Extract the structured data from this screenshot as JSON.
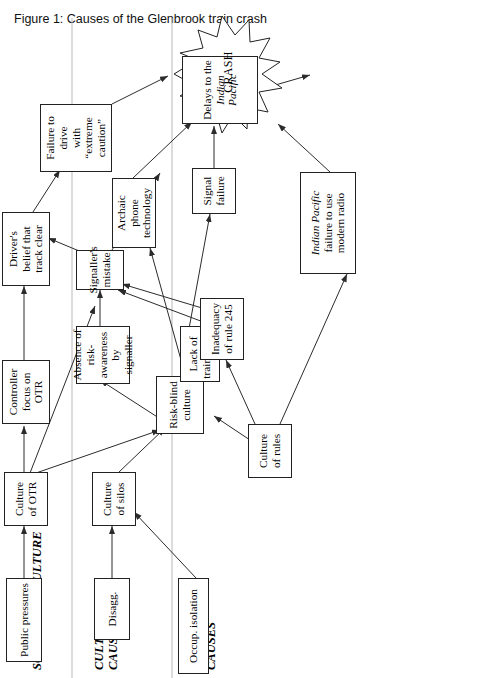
{
  "figure": {
    "caption": "Figure 1: Causes of the Glenbrook train crash",
    "columns": [
      {
        "id": "sources",
        "label": "SOURCES OF CULTURE"
      },
      {
        "id": "cultural",
        "label": "CULTURAL\nCAUSES"
      },
      {
        "id": "specific",
        "label": "SPECIFIC\nCAUSES"
      }
    ],
    "outcome_label": "CRASH",
    "colors": {
      "box_border": "#222222",
      "edge": "#2b2b2b",
      "divider": "#b9b9b9",
      "background": "#ffffff"
    },
    "nodes": [
      {
        "id": "public_pressures",
        "label": "Public pressures",
        "column": "sources"
      },
      {
        "id": "disagg",
        "label": "Disagg.",
        "column": "sources"
      },
      {
        "id": "occup_isolation",
        "label": "Occup. isolation",
        "column": "sources"
      },
      {
        "id": "culture_otr",
        "label": "Culture\nof OTR",
        "column": "cultural"
      },
      {
        "id": "culture_silos",
        "label": "Culture\nof silos",
        "column": "cultural"
      },
      {
        "id": "risk_blind",
        "label": "Risk-blind\nculture",
        "column": "cultural"
      },
      {
        "id": "culture_rules",
        "label": "Culture\nof rules",
        "column": "cultural"
      },
      {
        "id": "controller_focus",
        "label": "Controller\nfocus on\nOTR",
        "column": "specific"
      },
      {
        "id": "absence_risk",
        "label": "Absence of\nrisk-awareness\nby signaller",
        "column": "specific"
      },
      {
        "id": "lack_board",
        "label": "Lack of\ntrain board",
        "column": "specific"
      },
      {
        "id": "inadequacy_245",
        "label": "Inadequacy\nof rule 245",
        "column": "specific"
      },
      {
        "id": "drivers_belief",
        "label": "Driver's\nbelief that\ntrack clear",
        "column": "specific"
      },
      {
        "id": "signallers_mistake",
        "label": "Signaller's\nmistake",
        "column": "specific"
      },
      {
        "id": "archaic_phone",
        "label": "Archaic phone\ntechnology",
        "column": "specific"
      },
      {
        "id": "signal_failure",
        "label": "Signal\nfailure",
        "column": "specific"
      },
      {
        "id": "ip_radio",
        "label_italic": "Indian Pacific",
        "label_rest": "failure to use\nmodern radio",
        "column": "specific"
      },
      {
        "id": "delays_ip",
        "label_plain": "Delays to the",
        "label_italic2": "Indian Pacific",
        "column": "specific"
      },
      {
        "id": "failure_drive",
        "label": "Failure to drive\nwith “extreme\ncaution”",
        "column": "specific"
      }
    ],
    "edges": [
      {
        "from": "public_pressures",
        "to": "culture_otr"
      },
      {
        "from": "disagg",
        "to": "culture_silos"
      },
      {
        "from": "occup_isolation",
        "to": "culture_silos"
      },
      {
        "from": "culture_otr",
        "to": "risk_blind"
      },
      {
        "from": "culture_silos",
        "to": "risk_blind"
      },
      {
        "from": "culture_rules",
        "to": "risk_blind"
      },
      {
        "from": "culture_rules",
        "to": "inadequacy_245"
      },
      {
        "from": "culture_rules",
        "to": "ip_radio"
      },
      {
        "from": "culture_otr",
        "to": "controller_focus"
      },
      {
        "from": "culture_otr",
        "to": "signallers_mistake"
      },
      {
        "from": "risk_blind",
        "to": "absence_risk"
      },
      {
        "from": "risk_blind",
        "to": "lack_board"
      },
      {
        "from": "risk_blind",
        "to": "archaic_phone"
      },
      {
        "from": "risk_blind",
        "to": "signal_failure"
      },
      {
        "from": "inadequacy_245",
        "to": "signallers_mistake"
      },
      {
        "from": "lack_board",
        "to": "signallers_mistake"
      },
      {
        "from": "absence_risk",
        "to": "signallers_mistake"
      },
      {
        "from": "controller_focus",
        "to": "drivers_belief"
      },
      {
        "from": "signallers_mistake",
        "to": "drivers_belief"
      },
      {
        "from": "signallers_mistake",
        "to": "failure_drive"
      },
      {
        "from": "drivers_belief",
        "to": "failure_drive"
      },
      {
        "from": "signal_failure",
        "to": "delays_ip"
      },
      {
        "from": "ip_radio",
        "to": "delays_ip"
      },
      {
        "from": "archaic_phone",
        "to": "delays_ip"
      },
      {
        "from": "delays_ip",
        "to": "crash"
      },
      {
        "from": "failure_drive",
        "to": "crash"
      }
    ]
  }
}
